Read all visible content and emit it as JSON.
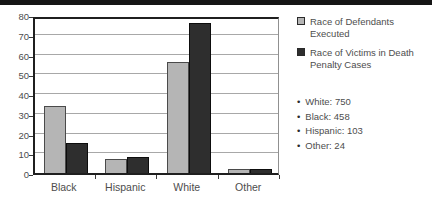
{
  "page": {
    "top_bar_color": "#151515",
    "background": "#ffffff"
  },
  "chart_data": {
    "type": "bar",
    "categories": [
      "Black",
      "Hispanic",
      "White",
      "Other"
    ],
    "series": [
      {
        "name": "Race of Defendants Executed",
        "color": "#b5b5b5",
        "border_color": "#4a4a4a",
        "values": [
          34,
          7,
          56,
          2
        ]
      },
      {
        "name": "Race of Victims in Death Penalty Cases",
        "color": "#2e2e2e",
        "border_color": "#0d0d0d",
        "values": [
          15,
          8,
          76,
          2
        ]
      }
    ],
    "title": "",
    "xlabel": "",
    "ylabel": "",
    "ylim": [
      0,
      80
    ],
    "yticks": [
      0,
      10,
      20,
      30,
      40,
      50,
      60,
      70,
      80
    ],
    "grid": true,
    "gridline_color": "#a8a8a8",
    "legend_position": "right"
  },
  "legend": {
    "items": [
      {
        "label": "Race of Defendants Executed",
        "swatch_color": "#b5b5b5"
      },
      {
        "label": "Race of Victims in Death Penalty Cases",
        "swatch_color": "#2e2e2e"
      }
    ]
  },
  "stats": {
    "bullet": "•",
    "items": [
      "White: 750",
      "Black: 458",
      "Hispanic: 103",
      "Other: 24"
    ]
  }
}
